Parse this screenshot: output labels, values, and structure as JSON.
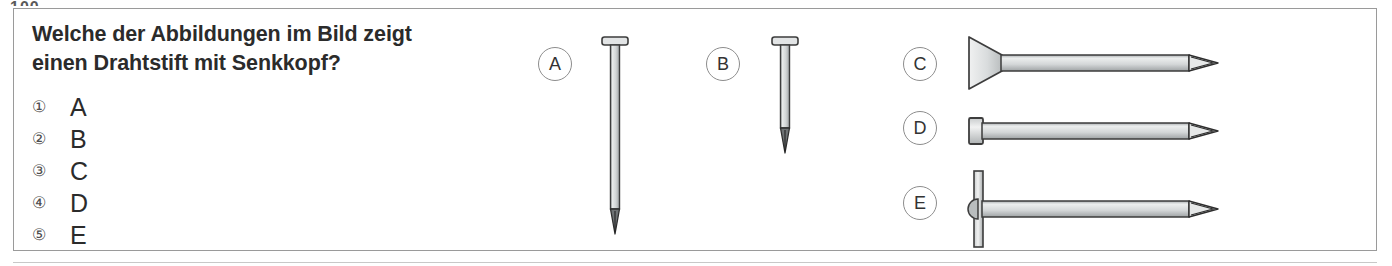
{
  "page": {
    "cut_off_header": "100",
    "background_color": "#ffffff",
    "border_color": "#9a9a9a"
  },
  "question": {
    "line1": "Welche der Abbildungen im Bild zeigt",
    "line2": "einen Drahtstift mit Senkkopf?",
    "text_color": "#2b2b2b"
  },
  "options": [
    {
      "number": "①",
      "letter": "A"
    },
    {
      "number": "②",
      "letter": "B"
    },
    {
      "number": "③",
      "letter": "C"
    },
    {
      "number": "④",
      "letter": "D"
    },
    {
      "number": "⑤",
      "letter": "E"
    }
  ],
  "figures": {
    "markers": [
      {
        "label": "A"
      },
      {
        "label": "B"
      },
      {
        "label": "C"
      },
      {
        "label": "D"
      },
      {
        "label": "E"
      }
    ],
    "nails": [
      {
        "label": "A",
        "orientation": "vertical",
        "head_type": "flat-head",
        "length": "long",
        "outline_color": "#3d3d3d",
        "shaft_color": "#d7d9da"
      },
      {
        "label": "B",
        "orientation": "vertical",
        "head_type": "flat-head",
        "length": "short",
        "outline_color": "#3d3d3d",
        "shaft_color": "#d7d9da"
      },
      {
        "label": "C",
        "orientation": "horizontal",
        "head_type": "countersunk-head",
        "length": "long",
        "outline_color": "#3d3d3d",
        "shaft_color": "#d7d9da"
      },
      {
        "label": "D",
        "orientation": "horizontal",
        "head_type": "small-flat-head",
        "length": "long",
        "outline_color": "#3d3d3d",
        "shaft_color": "#d7d9da"
      },
      {
        "label": "E",
        "orientation": "horizontal",
        "head_type": "large-disc-head",
        "length": "long",
        "outline_color": "#3d3d3d",
        "shaft_color": "#d7d9da"
      }
    ]
  }
}
